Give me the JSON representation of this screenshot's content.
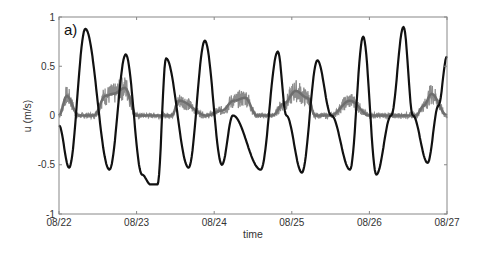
{
  "chart_data": {
    "type": "line",
    "title": "",
    "panel_label": "a)",
    "xlabel": "time",
    "ylabel": "u (m/s)",
    "ylim": [
      -1,
      1
    ],
    "yticks": [
      -1,
      -0.5,
      0,
      0.5,
      1
    ],
    "ytick_labels": [
      "-1",
      "-0.5",
      "0",
      "0.5",
      "1"
    ],
    "xlim_days": [
      0,
      5
    ],
    "xtick_labels": [
      "08/22",
      "08/23",
      "08/24",
      "08/25",
      "08/26",
      "08/27"
    ],
    "grid": false,
    "legend": null,
    "series": [
      {
        "name": "tidal velocity (black)",
        "color": "#111111",
        "note": "approximate extrema read off the plot; x in days since 08/22",
        "x": [
          0.0,
          0.13,
          0.34,
          0.65,
          0.86,
          1.07,
          1.18,
          1.27,
          1.38,
          1.67,
          1.88,
          2.1,
          2.24,
          2.6,
          2.82,
          2.93,
          3.13,
          3.33,
          3.51,
          3.75,
          3.92,
          4.09,
          4.28,
          4.44,
          4.56,
          4.75,
          4.89,
          5.0
        ],
        "y": [
          -0.1,
          -0.53,
          0.88,
          -0.55,
          0.62,
          -0.6,
          -0.7,
          -0.7,
          0.58,
          -0.53,
          0.76,
          -0.5,
          0.0,
          -0.55,
          0.65,
          0.0,
          -0.58,
          0.56,
          0.0,
          -0.55,
          0.8,
          -0.6,
          0.0,
          0.9,
          0.0,
          -0.48,
          0.1,
          0.6
        ]
      },
      {
        "name": "measured velocity (gray, noisy)",
        "color": "#808080",
        "note": "noisy signal alternating between ~0 baseline and positive humps of ~0.15-0.3",
        "x": [
          0.0,
          0.1,
          0.25,
          0.45,
          0.6,
          0.7,
          0.85,
          1.0,
          1.25,
          1.45,
          1.55,
          1.9,
          2.1,
          2.25,
          2.4,
          2.55,
          2.75,
          2.9,
          3.05,
          3.2,
          3.3,
          3.5,
          3.75,
          4.0,
          4.15,
          4.35,
          4.6,
          4.7,
          4.8,
          5.0
        ],
        "y": [
          0.0,
          0.2,
          0.0,
          0.0,
          0.2,
          0.22,
          0.28,
          0.0,
          0.0,
          0.0,
          0.15,
          0.0,
          0.05,
          0.15,
          0.18,
          0.0,
          0.0,
          0.12,
          0.25,
          0.18,
          0.0,
          0.0,
          0.15,
          0.0,
          0.0,
          0.0,
          0.0,
          0.1,
          0.22,
          0.0
        ]
      }
    ]
  }
}
